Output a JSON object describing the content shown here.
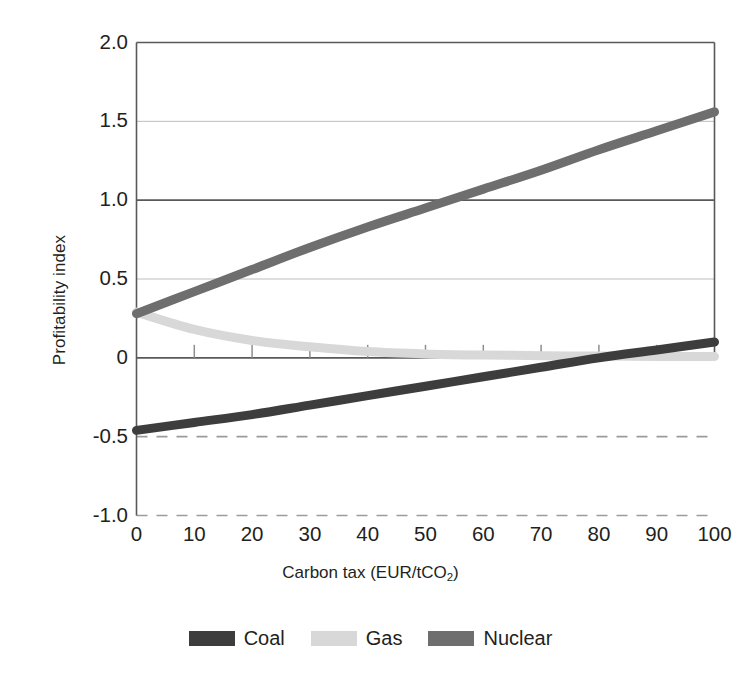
{
  "chart_data": {
    "type": "line",
    "title": "",
    "xlabel": "Carbon tax (EUR/tCO2)",
    "xlabel_main": "Carbon tax (EUR/tCO",
    "xlabel_sub": "2",
    "xlabel_tail": ")",
    "ylabel": "Profitability index",
    "xlim": [
      0,
      100
    ],
    "ylim": [
      -1.0,
      2.0
    ],
    "xticks": [
      0,
      10,
      20,
      30,
      40,
      50,
      60,
      70,
      80,
      90,
      100
    ],
    "xtick_labels": [
      "0",
      "10",
      "20",
      "30",
      "40",
      "50",
      "60",
      "70",
      "80",
      "90",
      "100"
    ],
    "yticks": [
      2.0,
      1.5,
      1.0,
      0.5,
      0,
      -0.5,
      -1.0
    ],
    "ytick_labels": [
      "2.0",
      "1.5",
      "1.0",
      "0.5",
      "0",
      "-0.5",
      "-1.0"
    ],
    "grid": true,
    "gridlines_solid": [
      2.0,
      1.5,
      1.0,
      0.5,
      0
    ],
    "gridlines_dashed": [
      -0.5,
      -1.0
    ],
    "legend_position": "bottom",
    "x": [
      0,
      10,
      20,
      30,
      40,
      50,
      60,
      70,
      80,
      90,
      100
    ],
    "series": [
      {
        "name": "Coal",
        "color": "#3d3d3d",
        "values": [
          -0.46,
          -0.41,
          -0.36,
          -0.3,
          -0.24,
          -0.18,
          -0.12,
          -0.06,
          0.0,
          0.05,
          0.1
        ]
      },
      {
        "name": "Gas",
        "color": "#d8d8d8",
        "values": [
          0.29,
          0.18,
          0.11,
          0.07,
          0.04,
          0.025,
          0.018,
          0.014,
          0.011,
          0.009,
          0.008
        ]
      },
      {
        "name": "Nuclear",
        "color": "#6e6e6e",
        "values": [
          0.28,
          0.42,
          0.56,
          0.7,
          0.83,
          0.95,
          1.07,
          1.19,
          1.32,
          1.44,
          1.56
        ]
      }
    ]
  },
  "legend": {
    "items": [
      {
        "label": "Coal",
        "color": "#3d3d3d"
      },
      {
        "label": "Gas",
        "color": "#d8d8d8"
      },
      {
        "label": "Nuclear",
        "color": "#6e6e6e"
      }
    ]
  },
  "axes": {
    "y_title": "Profitability index",
    "x_title_main": "Carbon tax (EUR/tCO",
    "x_title_sub": "2",
    "x_title_tail": ")"
  },
  "colors": {
    "coal": "#3d3d3d",
    "gas": "#d8d8d8",
    "nuclear": "#6e6e6e",
    "axis": "#58595b",
    "grid_light": "#bcbdc0",
    "text": "#231f20"
  }
}
